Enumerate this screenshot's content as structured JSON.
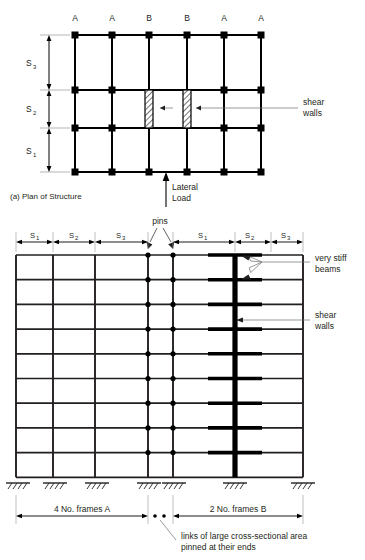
{
  "figure": {
    "title_caption": "(a) Plan of Structure",
    "domain": "structural-engineering-diagram"
  },
  "plan": {
    "caption": "(a) Plan of Structure",
    "column_labels": [
      "A",
      "A",
      "B",
      "B",
      "A",
      "A"
    ],
    "bay_labels_vertical": [
      "S",
      "S",
      "S"
    ],
    "bay_label_subs": [
      "3",
      "2",
      "1"
    ],
    "spacing_top_to_bottom": [
      "S3",
      "S2",
      "S1"
    ],
    "annotation_shear_walls_line1": "shear",
    "annotation_shear_walls_line2": "walls",
    "load_label_line1": "Lateral",
    "load_label_line2": "Load",
    "grid_columns": 6,
    "grid_rows": 4,
    "shear_wall_count": 2,
    "shear_wall_bays": [
      "B",
      "B"
    ]
  },
  "elevation": {
    "dim_left": [
      {
        "label": "S",
        "sub": "1"
      },
      {
        "label": "S",
        "sub": "2"
      },
      {
        "label": "S",
        "sub": "3"
      }
    ],
    "dim_right": [
      {
        "label": "S",
        "sub": "1"
      },
      {
        "label": "S",
        "sub": "2"
      },
      {
        "label": "S",
        "sub": "3"
      }
    ],
    "pins_label": "pins",
    "annotation_stiff_beams_line1": "very stiff",
    "annotation_stiff_beams_line2": "beams",
    "annotation_shear_walls_line1": "shear",
    "annotation_shear_walls_line2": "walls",
    "bottom_left_label": "4 No. frames A",
    "bottom_right_label": "2 No. frames B",
    "links_note_line1": "links of large cross-sectional area",
    "links_note_line2": "pinned at their ends",
    "storey_count": 9,
    "pin_levels": 9,
    "stiff_beam_count": 9,
    "support_count": 7
  },
  "colors": {
    "ink": "#231f20",
    "heavy": "#000000",
    "leader": "#6d6e71",
    "background": "#ffffff"
  }
}
